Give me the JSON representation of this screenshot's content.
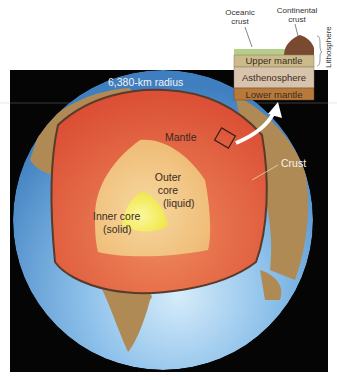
{
  "diagram": {
    "title_radius": "6,380-km radius",
    "labels": {
      "mantle": "Mantle",
      "crust": "Crust",
      "outer_core_line1": "Outer",
      "outer_core_line2": "core",
      "outer_core_line3": "(liquid)",
      "inner_core_line1": "Inner core",
      "inner_core_line2": "(solid)"
    },
    "inset": {
      "oceanic_crust_line1": "Oceanic",
      "oceanic_crust_line2": "crust",
      "continental_crust_line1": "Continental",
      "continental_crust_line2": "crust",
      "lithosphere": "Lithosphere",
      "layers": [
        "Upper mantle",
        "Asthenosphere",
        "Lower mantle"
      ]
    },
    "colors": {
      "background_panel": "#050505",
      "ocean": "#6aa6dc",
      "land": "#b08a55",
      "mantle": "#e0553a",
      "outer_core": "#f1c27a",
      "inner_core": "#f5ea3c",
      "upper_mantle": "#cbbb8a",
      "asthenosphere": "#d8c4ad",
      "lower_mantle": "#b87a3a",
      "oceanic_crust": "#b5cf8a",
      "continental_crust": "#7a4a30"
    }
  }
}
